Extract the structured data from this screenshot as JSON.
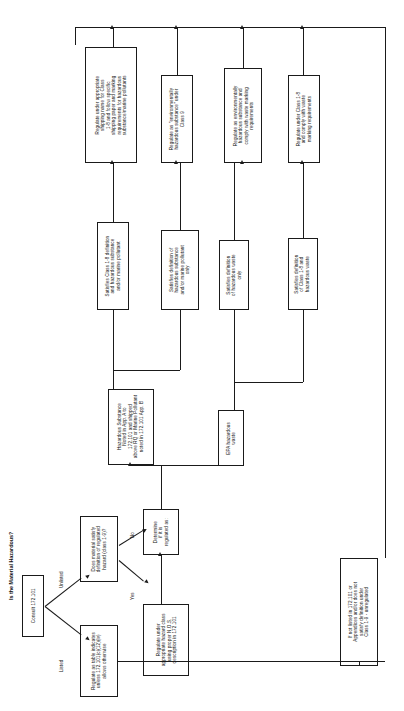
{
  "title": "Is the Material Hazardous?",
  "edge_labels": {
    "listed": "Listed",
    "unlisted": "Unlisted",
    "yes": "Yes",
    "no": "No"
  },
  "nodes": {
    "start": {
      "name": "consult-box",
      "lines": [
        "Consult 172.101"
      ]
    },
    "listed_action": {
      "name": "regulate-as-table-box",
      "lines": [
        "Regulate as table indicates",
        "unless 172.101(c)(12)(iv)",
        "allows otherwise"
      ]
    },
    "unlisted_question": {
      "name": "does-material-satisfy-box",
      "lines": [
        "Does material satisfy",
        "definition of regulated",
        "hazard (class 1-9)?"
      ]
    },
    "yes_action": {
      "name": "regulate-nos-box",
      "lines": [
        "Regulate under",
        "appropriate hazard class",
        "using proper N.O.S.",
        "description in 172.101"
      ]
    },
    "determine": {
      "name": "determine-regulated-box",
      "lines": [
        "Determine",
        "if it is",
        "regulated as:"
      ]
    },
    "haz_substance": {
      "name": "hazardous-substance-box",
      "lines": [
        "Hazardous Substance",
        "Noted in App. A to",
        "172.101 and shipped",
        "above RQ or Marine Pollutant",
        "noted in 172.101 App. B"
      ]
    },
    "epa_waste": {
      "name": "epa-hazardous-waste-box",
      "lines": [
        "EPA hazardous",
        "waste"
      ]
    },
    "cat1": {
      "name": "satisfies-class-1-8-and-hazsub-box",
      "lines": [
        "Satisfies Class 1-8 definition",
        "and hazardous substance",
        "and/or marine pollutant"
      ]
    },
    "cat2": {
      "name": "satisfies-hazsub-only-box",
      "lines": [
        "Satisfies definition of",
        "hazardous substance",
        "and/or marine pollutant",
        "only"
      ]
    },
    "cat3": {
      "name": "satisfies-hazwaste-only-box",
      "lines": [
        "Satisfies definition",
        "of hazardous waste",
        "only"
      ]
    },
    "cat4": {
      "name": "satisfies-class-1-8-and-hazwaste-box",
      "lines": [
        "Satisfies definition",
        "of Class 1-8 and",
        "hazardous waste"
      ]
    },
    "res1": {
      "name": "regulate-appropriate-shipping-name-box",
      "lines": [
        "Regulate under appropriate",
        "shipping name for Class",
        "1-8 and follow specific",
        "shipping paper and marking",
        "requirements for hazardous",
        "substance/marine pollutants"
      ]
    },
    "res2": {
      "name": "regulate-environmentally-hazardous-box",
      "lines": [
        "Regulate as \"environmentally",
        "hazardous substance\" under",
        "Class 9"
      ]
    },
    "res3": {
      "name": "regulate-environmentally-hazardous-waste-marking-box",
      "lines": [
        "Regulate as environmentally",
        "hazardous substance and",
        "comply with waste marking",
        "requirements"
      ]
    },
    "res4": {
      "name": "regulate-class-1-8-waste-marking-box",
      "lines": [
        "Regulate under Class 1-8",
        "and comply with waste",
        "marking requirements"
      ]
    },
    "unregulated": {
      "name": "unregulated-box",
      "lines": [
        "If not listed in 172.101 or",
        "Appendices and/or does not",
        "satisfy definition under",
        "Class 1-9 - unregulated"
      ]
    }
  },
  "colors": {
    "line": "#1a1a1a",
    "box_fill": "#ffffff",
    "text": "#111111"
  }
}
